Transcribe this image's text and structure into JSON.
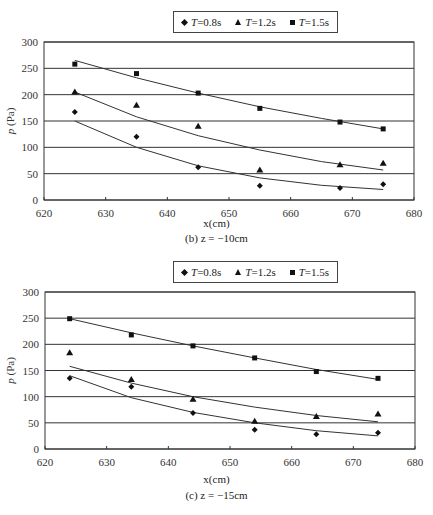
{
  "legend": {
    "items": [
      {
        "prefix": "T",
        "label": "=0.8s",
        "marker": "diamond"
      },
      {
        "prefix": "T",
        "label": "=1.2s",
        "marker": "triangle"
      },
      {
        "prefix": "T",
        "label": "=1.5s",
        "marker": "square"
      }
    ]
  },
  "charts": [
    {
      "ylabel": "p (Pa)",
      "xlabel": "x(cm)",
      "caption": "(b) z = −10cm"
    },
    {
      "ylabel": "p (Pa)",
      "xlabel": "x(cm)",
      "caption": "(c) z = −15cm"
    }
  ],
  "chart_data": [
    {
      "type": "scatter",
      "title": "(b) z = -10cm",
      "xlabel": "x(cm)",
      "ylabel": "p (Pa)",
      "xlim": [
        620,
        680
      ],
      "ylim": [
        0,
        300
      ],
      "xticks": [
        620,
        630,
        640,
        650,
        660,
        670,
        680
      ],
      "yticks": [
        0,
        50,
        100,
        150,
        200,
        250,
        300
      ],
      "grid": "horizontal",
      "legend_position": "top",
      "trendlines": true,
      "series": [
        {
          "name": "T=0.8s",
          "marker": "diamond",
          "x": [
            625,
            635,
            645,
            655,
            668,
            675
          ],
          "values": [
            167,
            120,
            62,
            27,
            23,
            30
          ],
          "fit": [
            [
              625,
              150
            ],
            [
              635,
              100
            ],
            [
              645,
              65
            ],
            [
              655,
              42
            ],
            [
              665,
              28
            ],
            [
              675,
              20
            ]
          ]
        },
        {
          "name": "T=1.2s",
          "marker": "triangle",
          "x": [
            625,
            635,
            645,
            655,
            668,
            675
          ],
          "values": [
            205,
            180,
            140,
            57,
            67,
            70
          ],
          "fit": [
            [
              625,
              205
            ],
            [
              635,
              158
            ],
            [
              645,
              122
            ],
            [
              655,
              95
            ],
            [
              665,
              73
            ],
            [
              675,
              57
            ]
          ]
        },
        {
          "name": "T=1.5s",
          "marker": "square",
          "x": [
            625,
            635,
            645,
            655,
            668,
            675
          ],
          "values": [
            258,
            240,
            203,
            174,
            148,
            135
          ],
          "fit": [
            [
              625,
              265
            ],
            [
              635,
              232
            ],
            [
              645,
              203
            ],
            [
              655,
              177
            ],
            [
              665,
              155
            ],
            [
              675,
              135
            ]
          ]
        }
      ]
    },
    {
      "type": "scatter",
      "title": "(c) z = -15cm",
      "xlabel": "x(cm)",
      "ylabel": "p (Pa)",
      "xlim": [
        620,
        680
      ],
      "ylim": [
        0,
        300
      ],
      "xticks": [
        620,
        630,
        640,
        650,
        660,
        670,
        680
      ],
      "yticks": [
        0,
        50,
        100,
        150,
        200,
        250,
        300
      ],
      "grid": "horizontal",
      "legend_position": "top",
      "trendlines": true,
      "series": [
        {
          "name": "T=0.8s",
          "marker": "diamond",
          "x": [
            624,
            634,
            644,
            654,
            664,
            674
          ],
          "values": [
            135,
            119,
            69,
            37,
            28,
            31
          ],
          "fit": [
            [
              624,
              140
            ],
            [
              634,
              98
            ],
            [
              644,
              70
            ],
            [
              654,
              50
            ],
            [
              664,
              35
            ],
            [
              674,
              25
            ]
          ]
        },
        {
          "name": "T=1.2s",
          "marker": "triangle",
          "x": [
            624,
            634,
            644,
            654,
            664,
            674
          ],
          "values": [
            184,
            133,
            95,
            53,
            62,
            67
          ],
          "fit": [
            [
              624,
              158
            ],
            [
              634,
              126
            ],
            [
              644,
              100
            ],
            [
              654,
              80
            ],
            [
              664,
              64
            ],
            [
              674,
              52
            ]
          ]
        },
        {
          "name": "T=1.5s",
          "marker": "square",
          "x": [
            624,
            634,
            644,
            654,
            664,
            674
          ],
          "values": [
            249,
            218,
            197,
            174,
            148,
            135
          ],
          "fit": [
            [
              624,
              249
            ],
            [
              634,
              222
            ],
            [
              644,
              197
            ],
            [
              654,
              174
            ],
            [
              664,
              152
            ],
            [
              674,
              133
            ]
          ]
        }
      ]
    }
  ]
}
